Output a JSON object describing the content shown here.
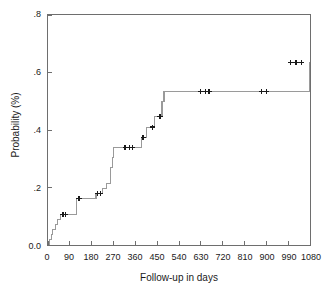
{
  "chart_data": {
    "type": "line",
    "title": "",
    "subtitle": "",
    "xlabel": "Follow-up in days",
    "ylabel": "Probability (%)",
    "xlim": [
      0,
      1080
    ],
    "ylim": [
      0.0,
      0.8
    ],
    "grid": false,
    "legend": "none",
    "xticks": [
      0,
      90,
      180,
      270,
      360,
      450,
      540,
      630,
      720,
      810,
      900,
      990,
      1080
    ],
    "xtick_labels": [
      "0",
      "90",
      "180",
      "270",
      "360",
      "450",
      "540",
      "630",
      "720",
      "810",
      "900",
      "990",
      "1080"
    ],
    "yticks": [
      0.0,
      0.2,
      0.4,
      0.6,
      0.8
    ],
    "ytick_labels": [
      "0.0",
      ".2",
      ".4",
      ".6",
      ".8"
    ],
    "series": [
      {
        "name": "Cumulative event probability",
        "style": "kaplan-meier-step",
        "color": "#9a9a9a",
        "x": [
          0,
          8,
          14,
          20,
          30,
          40,
          52,
          110,
          118,
          190,
          198,
          215,
          225,
          240,
          258,
          265,
          270,
          370,
          385,
          405,
          420,
          440,
          455,
          470,
          478,
          985,
          1080
        ],
        "y": [
          0.0,
          0.018,
          0.035,
          0.053,
          0.07,
          0.088,
          0.105,
          0.105,
          0.162,
          0.162,
          0.178,
          0.178,
          0.196,
          0.214,
          0.268,
          0.303,
          0.338,
          0.338,
          0.375,
          0.41,
          0.41,
          0.448,
          0.448,
          0.5,
          0.535,
          0.535,
          0.635
        ]
      }
    ],
    "censor_marks": {
      "symbol": "+",
      "color": "#1a1a1a",
      "points": [
        {
          "x": 62,
          "y": 0.105
        },
        {
          "x": 72,
          "y": 0.105
        },
        {
          "x": 128,
          "y": 0.162
        },
        {
          "x": 205,
          "y": 0.178
        },
        {
          "x": 216,
          "y": 0.178
        },
        {
          "x": 318,
          "y": 0.338
        },
        {
          "x": 336,
          "y": 0.338
        },
        {
          "x": 348,
          "y": 0.338
        },
        {
          "x": 392,
          "y": 0.375
        },
        {
          "x": 430,
          "y": 0.41
        },
        {
          "x": 462,
          "y": 0.448
        },
        {
          "x": 630,
          "y": 0.535
        },
        {
          "x": 648,
          "y": 0.535
        },
        {
          "x": 664,
          "y": 0.535
        },
        {
          "x": 880,
          "y": 0.535
        },
        {
          "x": 902,
          "y": 0.535
        },
        {
          "x": 1000,
          "y": 0.635
        },
        {
          "x": 1022,
          "y": 0.635
        },
        {
          "x": 1044,
          "y": 0.635
        }
      ]
    }
  }
}
